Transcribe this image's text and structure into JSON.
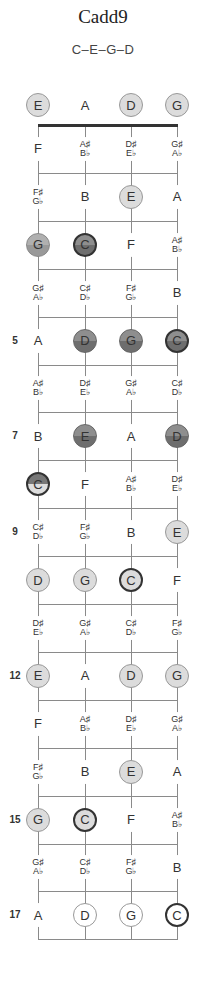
{
  "title": "Cadd9",
  "formula": "C–E–G–D",
  "layout": {
    "strings_x": [
      38,
      85,
      131,
      177
    ],
    "nut_y": 125,
    "fret_spacing": 47.9,
    "open_y": 105
  },
  "fret_markers": [
    {
      "fret": 5,
      "label": "5"
    },
    {
      "fret": 7,
      "label": "7"
    },
    {
      "fret": 9,
      "label": "9"
    },
    {
      "fret": 12,
      "label": "12"
    },
    {
      "fret": 15,
      "label": "15"
    },
    {
      "fret": 17,
      "label": "17"
    }
  ],
  "rows": [
    {
      "fret": 0,
      "notes": [
        {
          "t": "E",
          "s": "light"
        },
        {
          "t": "A",
          "s": "plain"
        },
        {
          "t": "D",
          "s": "light"
        },
        {
          "t": "G",
          "s": "light"
        }
      ]
    },
    {
      "fret": 1,
      "notes": [
        {
          "t": "F",
          "s": "plain"
        },
        {
          "t": "A♯\nB♭",
          "s": "plain"
        },
        {
          "t": "D♯\nE♭",
          "s": "plain"
        },
        {
          "t": "G♯\nA♭",
          "s": "plain"
        }
      ]
    },
    {
      "fret": 2,
      "notes": [
        {
          "t": "F♯\nG♭",
          "s": "plain"
        },
        {
          "t": "B",
          "s": "plain"
        },
        {
          "t": "E",
          "s": "light"
        },
        {
          "t": "A",
          "s": "plain"
        }
      ]
    },
    {
      "fret": 3,
      "notes": [
        {
          "t": "G",
          "s": "mid"
        },
        {
          "t": "C",
          "s": "darkroot"
        },
        {
          "t": "F",
          "s": "plain"
        },
        {
          "t": "A♯\nB♭",
          "s": "plain"
        }
      ]
    },
    {
      "fret": 4,
      "notes": [
        {
          "t": "G♯\nA♭",
          "s": "plain"
        },
        {
          "t": "C♯\nD♭",
          "s": "plain"
        },
        {
          "t": "F♯\nG♭",
          "s": "plain"
        },
        {
          "t": "B",
          "s": "plain"
        }
      ]
    },
    {
      "fret": 5,
      "notes": [
        {
          "t": "A",
          "s": "plain"
        },
        {
          "t": "D",
          "s": "dark"
        },
        {
          "t": "G",
          "s": "dark"
        },
        {
          "t": "C",
          "s": "darkroot"
        }
      ]
    },
    {
      "fret": 6,
      "notes": [
        {
          "t": "A♯\nB♭",
          "s": "plain"
        },
        {
          "t": "D♯\nE♭",
          "s": "plain"
        },
        {
          "t": "G♯\nA♭",
          "s": "plain"
        },
        {
          "t": "C♯\nD♭",
          "s": "plain"
        }
      ]
    },
    {
      "fret": 7,
      "notes": [
        {
          "t": "B",
          "s": "plain"
        },
        {
          "t": "E",
          "s": "dark"
        },
        {
          "t": "A",
          "s": "plain"
        },
        {
          "t": "D",
          "s": "dark"
        }
      ]
    },
    {
      "fret": 8,
      "notes": [
        {
          "t": "C",
          "s": "split"
        },
        {
          "t": "F",
          "s": "plain"
        },
        {
          "t": "A♯\nB♭",
          "s": "plain"
        },
        {
          "t": "D♯\nE♭",
          "s": "plain"
        }
      ]
    },
    {
      "fret": 9,
      "notes": [
        {
          "t": "C♯\nD♭",
          "s": "plain"
        },
        {
          "t": "F♯\nG♭",
          "s": "plain"
        },
        {
          "t": "B",
          "s": "plain"
        },
        {
          "t": "E",
          "s": "light"
        }
      ]
    },
    {
      "fret": 10,
      "notes": [
        {
          "t": "D",
          "s": "light"
        },
        {
          "t": "G",
          "s": "light"
        },
        {
          "t": "C",
          "s": "root"
        },
        {
          "t": "F",
          "s": "plain"
        }
      ]
    },
    {
      "fret": 11,
      "notes": [
        {
          "t": "D♯\nE♭",
          "s": "plain"
        },
        {
          "t": "G♯\nA♭",
          "s": "plain"
        },
        {
          "t": "C♯\nD♭",
          "s": "plain"
        },
        {
          "t": "F♯\nG♭",
          "s": "plain"
        }
      ]
    },
    {
      "fret": 12,
      "notes": [
        {
          "t": "E",
          "s": "light"
        },
        {
          "t": "A",
          "s": "plain"
        },
        {
          "t": "D",
          "s": "light"
        },
        {
          "t": "G",
          "s": "light"
        }
      ]
    },
    {
      "fret": 13,
      "notes": [
        {
          "t": "F",
          "s": "plain"
        },
        {
          "t": "A♯\nB♭",
          "s": "plain"
        },
        {
          "t": "D♯\nE♭",
          "s": "plain"
        },
        {
          "t": "G♯\nA♭",
          "s": "plain"
        }
      ]
    },
    {
      "fret": 14,
      "notes": [
        {
          "t": "F♯\nG♭",
          "s": "plain"
        },
        {
          "t": "B",
          "s": "plain"
        },
        {
          "t": "E",
          "s": "light"
        },
        {
          "t": "A",
          "s": "plain"
        }
      ]
    },
    {
      "fret": 15,
      "notes": [
        {
          "t": "G",
          "s": "light"
        },
        {
          "t": "C",
          "s": "root"
        },
        {
          "t": "F",
          "s": "plain"
        },
        {
          "t": "A♯\nB♭",
          "s": "plain"
        }
      ]
    },
    {
      "fret": 16,
      "notes": [
        {
          "t": "G♯\nA♭",
          "s": "plain"
        },
        {
          "t": "C♯\nD♭",
          "s": "plain"
        },
        {
          "t": "F♯\nG♭",
          "s": "plain"
        },
        {
          "t": "B",
          "s": "plain"
        }
      ]
    },
    {
      "fret": 17,
      "notes": [
        {
          "t": "A",
          "s": "plain"
        },
        {
          "t": "D",
          "s": "outline"
        },
        {
          "t": "G",
          "s": "outline"
        },
        {
          "t": "C",
          "s": "outlineroot"
        }
      ]
    }
  ]
}
